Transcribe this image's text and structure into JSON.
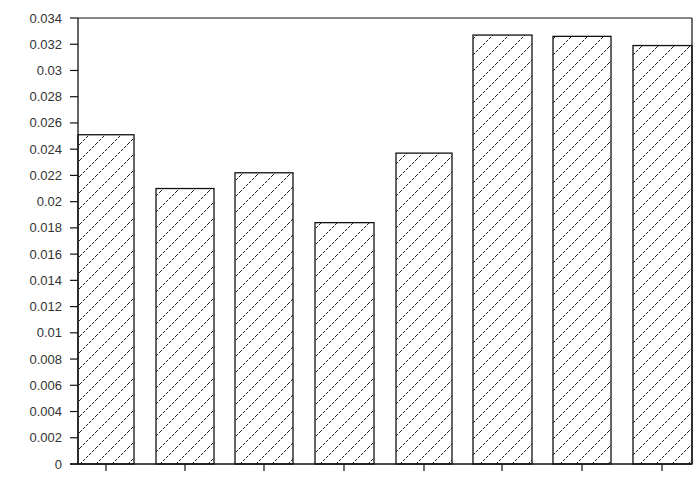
{
  "chart_data": {
    "type": "bar",
    "title": "",
    "xlabel": "",
    "ylabel": "",
    "categories": [
      "1",
      "2",
      "3",
      "4",
      "5",
      "6",
      "7",
      "8"
    ],
    "values": [
      0.0251,
      0.021,
      0.0222,
      0.0184,
      0.0237,
      0.0327,
      0.0326,
      0.0319
    ],
    "ylim": [
      0,
      0.034
    ],
    "yticks": [
      "0",
      "0.002",
      "0.004",
      "0.006",
      "0.008",
      "0.01",
      "0.012",
      "0.014",
      "0.016",
      "0.018",
      "0.02",
      "0.022",
      "0.024",
      "0.026",
      "0.028",
      "0.03",
      "0.032",
      "0.034"
    ],
    "grid": false,
    "legend": null,
    "bar_fill": "diagonal-hatch",
    "colors": {
      "bar_edge": "#111111",
      "hatch": "#222222",
      "background": "#ffffff",
      "axis": "#111111"
    }
  }
}
